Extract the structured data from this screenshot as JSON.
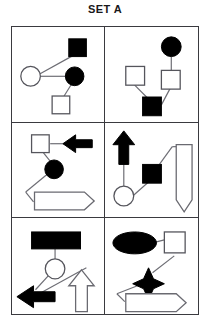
{
  "title": "SET A",
  "figure": {
    "kind": "abstract-reasoning-set",
    "grid": {
      "rows": 3,
      "columns": 2,
      "cell_count": 6
    },
    "cells": [
      {
        "position": "top-left",
        "index": 1,
        "shapes": [
          {
            "name": "black-square",
            "shape": "square",
            "fill": "black",
            "x": 62,
            "y": 14
          },
          {
            "name": "white-circle",
            "shape": "circle",
            "fill": "white",
            "x": 17,
            "y": 45
          },
          {
            "name": "black-circle",
            "shape": "circle",
            "fill": "black",
            "x": 62,
            "y": 45
          },
          {
            "name": "white-square",
            "shape": "square",
            "fill": "white",
            "x": 48,
            "y": 74
          }
        ],
        "links": [
          [
            "white-circle",
            "black-square"
          ],
          [
            "white-circle",
            "black-circle"
          ],
          [
            "black-circle",
            "white-square"
          ]
        ]
      },
      {
        "position": "top-right",
        "index": 2,
        "shapes": [
          {
            "name": "black-circle",
            "shape": "circle",
            "fill": "black",
            "x": 69,
            "y": 14
          },
          {
            "name": "white-square-left",
            "shape": "square",
            "fill": "white",
            "x": 26,
            "y": 42
          },
          {
            "name": "white-square-right",
            "shape": "square",
            "fill": "white",
            "x": 66,
            "y": 46
          },
          {
            "name": "black-square",
            "shape": "square",
            "fill": "black",
            "x": 38,
            "y": 74
          }
        ],
        "links": [
          [
            "black-circle",
            "white-square-right"
          ],
          [
            "white-square-left",
            "black-square"
          ],
          [
            "black-square",
            "white-square-right"
          ]
        ]
      },
      {
        "position": "middle-left",
        "index": 3,
        "shapes": [
          {
            "name": "white-square",
            "shape": "square",
            "fill": "white",
            "x": 20,
            "y": 14
          },
          {
            "name": "black-left-arrow",
            "shape": "arrow-left",
            "fill": "black",
            "x": 52,
            "y": 14
          },
          {
            "name": "black-circle",
            "shape": "circle",
            "fill": "black",
            "x": 38,
            "y": 42
          },
          {
            "name": "white-right-banner",
            "shape": "arrow-right-banner",
            "fill": "white",
            "x": 22,
            "y": 70
          }
        ],
        "links": [
          [
            "white-square",
            "black-left-arrow"
          ],
          [
            "white-square",
            "black-circle"
          ],
          [
            "black-circle",
            "white-right-banner"
          ]
        ]
      },
      {
        "position": "middle-right",
        "index": 4,
        "shapes": [
          {
            "name": "black-up-arrow",
            "shape": "arrow-up",
            "fill": "black",
            "x": 16,
            "y": 10
          },
          {
            "name": "white-circle",
            "shape": "circle",
            "fill": "white",
            "x": 16,
            "y": 72
          },
          {
            "name": "black-square",
            "shape": "square",
            "fill": "black",
            "x": 48,
            "y": 42
          },
          {
            "name": "white-down-banner",
            "shape": "banner-down",
            "fill": "white",
            "x": 72,
            "y": 22
          }
        ],
        "links": [
          [
            "black-up-arrow",
            "white-circle"
          ],
          [
            "white-circle",
            "black-square"
          ],
          [
            "black-square",
            "white-down-banner"
          ]
        ]
      },
      {
        "position": "bottom-left",
        "index": 5,
        "shapes": [
          {
            "name": "black-rectangle",
            "shape": "rectangle",
            "fill": "black",
            "x": 24,
            "y": 14
          },
          {
            "name": "white-circle",
            "shape": "circle",
            "fill": "white",
            "x": 40,
            "y": 46
          },
          {
            "name": "black-left-arrow",
            "shape": "arrow-left",
            "fill": "black",
            "x": 8,
            "y": 72
          },
          {
            "name": "white-up-arrow",
            "shape": "arrow-up",
            "fill": "white",
            "x": 62,
            "y": 56
          }
        ],
        "links": [
          [
            "black-rectangle",
            "white-circle"
          ],
          [
            "white-circle",
            "black-left-arrow"
          ],
          [
            "black-left-arrow",
            "white-up-arrow"
          ]
        ]
      },
      {
        "position": "bottom-right",
        "index": 6,
        "shapes": [
          {
            "name": "black-ellipse",
            "shape": "ellipse",
            "fill": "black",
            "x": 14,
            "y": 18
          },
          {
            "name": "white-square",
            "shape": "square",
            "fill": "white",
            "x": 64,
            "y": 14
          },
          {
            "name": "black-four-point-star",
            "shape": "star-4",
            "fill": "black",
            "x": 36,
            "y": 52
          },
          {
            "name": "white-right-banner",
            "shape": "arrow-right-banner",
            "fill": "white",
            "x": 16,
            "y": 76
          }
        ],
        "links": [
          [
            "black-ellipse",
            "white-square"
          ],
          [
            "white-square",
            "black-four-point-star"
          ],
          [
            "black-four-point-star",
            "white-right-banner"
          ]
        ]
      }
    ]
  },
  "colors": {
    "filled": "#000000",
    "outline_stroke": "#6a6a71",
    "grid_border": "#3a3a3f",
    "background": "#ffffff",
    "title_text": "#19181a"
  }
}
